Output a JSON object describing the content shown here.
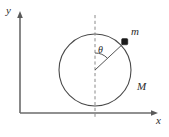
{
  "figure": {
    "background_color": "#ffffff",
    "width": 169,
    "height": 137,
    "axes": {
      "x_axis_label": "x",
      "y_axis_label": "y",
      "axis_color": "#6b6b6b",
      "origin_x": 20,
      "origin_y": 113,
      "x_axis_end": 157,
      "y_axis_top": 13
    },
    "hoop": {
      "label": "M",
      "center_x": 95,
      "center_y": 70,
      "radius": 36,
      "stroke_color": "#4a4a4a"
    },
    "point_mass": {
      "label": "m",
      "x": 125,
      "y": 42,
      "marker": "filled-square-dot",
      "color": "#1a1a1a"
    },
    "angle": {
      "label": "θ",
      "symbol_name": "theta",
      "vertex_x": 95,
      "vertex_y": 70,
      "degrees_from_vertical": 40,
      "arc_radius": 17
    },
    "vertical_reference": {
      "name": "dashed-vertical-axis",
      "style": "dashed",
      "color": "#8a8a8a",
      "x": 95,
      "y_top": 15,
      "y_bottom": 118
    },
    "radius_line": {
      "name": "center-to-mass-radius",
      "color": "#555555"
    }
  }
}
